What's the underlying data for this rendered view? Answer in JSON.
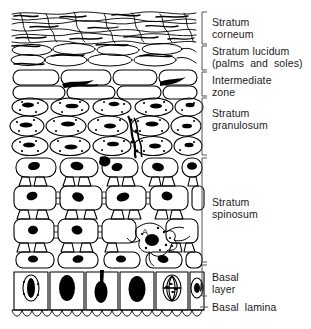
{
  "figure": {
    "type": "histology-schematic",
    "width": 311,
    "height": 329,
    "background_color": "#ffffff",
    "ink_color": "#000000"
  },
  "labels": [
    {
      "id": "stratum-corneum",
      "line1": "Stratum",
      "line2": "corneum",
      "text": "Stratum\ncorneum",
      "bracket": true,
      "bracket_top": 12,
      "bracket_bottom": 44
    },
    {
      "id": "stratum-lucidum",
      "line1": "Stratum lucidum",
      "line2": "(palms  and  soles)",
      "text": "Stratum lucidum\n(palms  and  soles)",
      "bracket": true,
      "bracket_top": 46,
      "bracket_bottom": 70
    },
    {
      "id": "intermediate-zone",
      "line1": "Intermediate",
      "line2": "zone",
      "text": "Intermediate\nzone",
      "bracket": true,
      "bracket_top": 72,
      "bracket_bottom": 96
    },
    {
      "id": "stratum-granulosum",
      "line1": "Stratum",
      "line2": "granulosum",
      "text": "Stratum\ngranulosum",
      "bracket": true,
      "bracket_top": 98,
      "bracket_bottom": 155
    },
    {
      "id": "stratum-spinosum",
      "line1": "Stratum",
      "line2": "spinosum",
      "text": "Stratum\nspinosum",
      "bracket": true,
      "bracket_top": 158,
      "bracket_bottom": 262
    },
    {
      "id": "basal-layer",
      "line1": "Basal",
      "line2": "layer",
      "text": "Basal\nlayer",
      "bracket": true,
      "bracket_top": 265,
      "bracket_bottom": 296
    },
    {
      "id": "basal-lamina",
      "line1": "Basal  lamina",
      "line2": "",
      "text": "Basal  lamina",
      "bracket": false,
      "bracket_top": 303,
      "bracket_bottom": 310
    }
  ],
  "cell_markers": [
    {
      "id": "marker-a",
      "text": "A",
      "x": 146,
      "y": 232,
      "描述": "dendritic cell in stratum spinosum"
    },
    {
      "id": "marker-b",
      "text": "B",
      "x": 118,
      "y": 167,
      "描述": "cell in upper stratum spinosum"
    }
  ],
  "layer_regions": [
    {
      "id": "corneum-region",
      "y_top": 10,
      "y_bottom": 44,
      "cell_style": "flattened-overlapping-squames"
    },
    {
      "id": "lucidum-region",
      "y_top": 44,
      "y_bottom": 70,
      "cell_style": "flattened-ovals"
    },
    {
      "id": "intermediate-region",
      "y_top": 70,
      "y_bottom": 98,
      "cell_style": "large-rounded-rectangles-with-dark-wedges"
    },
    {
      "id": "granulosum-region",
      "y_top": 98,
      "y_bottom": 156,
      "cell_style": "stippled-ovals-with-dark-granules"
    },
    {
      "id": "spinosum-region",
      "y_top": 156,
      "y_bottom": 264,
      "cell_style": "polygonal-cells-with-desmosome-spines"
    },
    {
      "id": "basal-region",
      "y_top": 264,
      "y_bottom": 312,
      "cell_style": "columnar-cells-with-large-nuclei"
    },
    {
      "id": "lamina-region",
      "y_top": 310,
      "y_bottom": 322,
      "cell_style": "scalloped-basement-membrane"
    }
  ]
}
